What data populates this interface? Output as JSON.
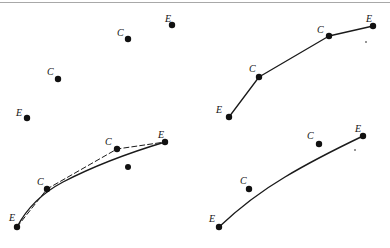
{
  "figure": {
    "title": "",
    "background_color": "#ffffff",
    "stroke_color": "#1a1a1a",
    "point_color": "#111111",
    "rule_color": "#a8a8a8",
    "width": 390,
    "height": 248
  },
  "legend": {
    "endpoint_symbol": "E",
    "control_symbol": "C"
  },
  "panels": [
    {
      "name": "panel-top-left-points-only",
      "description": "four scattered labelled points, no curve drawn",
      "curve": null,
      "control_polygon": null,
      "points": [
        {
          "label": "E",
          "x": 27,
          "y": 118,
          "label_x": 16,
          "label_y": 108,
          "kind": "endpoint"
        },
        {
          "label": "C",
          "x": 58,
          "y": 79,
          "label_x": 47,
          "label_y": 67,
          "kind": "control"
        },
        {
          "label": "C",
          "x": 128,
          "y": 39,
          "label_x": 117,
          "label_y": 28,
          "kind": "control"
        },
        {
          "label": "E",
          "x": 172,
          "y": 25,
          "label_x": 165,
          "label_y": 14,
          "kind": "endpoint"
        }
      ],
      "extra_dots": []
    },
    {
      "name": "panel-top-right-control-polygon",
      "description": "straight control polygon connecting E-C-C-E",
      "curve": null,
      "control_polygon": "M229,117 L259,77 L329,36 L373,26",
      "points": [
        {
          "label": "E",
          "x": 229,
          "y": 117,
          "label_x": 216,
          "label_y": 105,
          "kind": "endpoint"
        },
        {
          "label": "C",
          "x": 259,
          "y": 77,
          "label_x": 249,
          "label_y": 64,
          "kind": "control"
        },
        {
          "label": "C",
          "x": 329,
          "y": 36,
          "label_x": 317,
          "label_y": 25,
          "kind": "control"
        },
        {
          "label": "E",
          "x": 373,
          "y": 26,
          "label_x": 366,
          "label_y": 14,
          "kind": "endpoint"
        }
      ],
      "extra_dots": [
        {
          "x": 366,
          "y": 42,
          "radius": 0.8
        }
      ]
    },
    {
      "name": "panel-bottom-left-curve-with-polygon",
      "description": "smooth cubic curve plus dashed control polygon through the C points",
      "curve": "M17,227 C28,206 46,191 63,182 C88,169 115,157 165,142",
      "control_polygon": "M17,227 L47,189 L117,149 L165,142",
      "control_polygon_dashed": true,
      "points": [
        {
          "label": "E",
          "x": 17,
          "y": 227,
          "label_x": 9,
          "label_y": 213,
          "kind": "endpoint"
        },
        {
          "label": "C",
          "x": 47,
          "y": 189,
          "label_x": 37,
          "label_y": 177,
          "kind": "control"
        },
        {
          "label": "C",
          "x": 117,
          "y": 149,
          "label_x": 105,
          "label_y": 137,
          "kind": "control"
        },
        {
          "label": "E",
          "x": 165,
          "y": 142,
          "label_x": 158,
          "label_y": 130,
          "kind": "endpoint"
        }
      ],
      "extra_dots": [
        {
          "x": 128,
          "y": 167,
          "radius": 3
        }
      ]
    },
    {
      "name": "panel-bottom-right-smooth-curve",
      "description": "smooth cubic curve only, control points shown unconnected",
      "curve": "M219,227 C238,209 258,193 285,177 C315,159 340,147 363,136",
      "control_polygon": null,
      "points": [
        {
          "label": "E",
          "x": 219,
          "y": 227,
          "label_x": 209,
          "label_y": 214,
          "kind": "endpoint"
        },
        {
          "label": "C",
          "x": 249,
          "y": 189,
          "label_x": 240,
          "label_y": 176,
          "kind": "control"
        },
        {
          "label": "C",
          "x": 319,
          "y": 144,
          "label_x": 307,
          "label_y": 131,
          "kind": "control"
        },
        {
          "label": "E",
          "x": 363,
          "y": 136,
          "label_x": 355,
          "label_y": 124,
          "kind": "endpoint"
        }
      ],
      "extra_dots": [
        {
          "x": 355,
          "y": 150,
          "radius": 0.8
        }
      ]
    }
  ]
}
